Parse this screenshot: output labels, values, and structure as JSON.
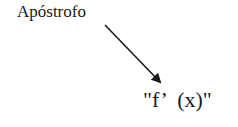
{
  "diagram": {
    "label": "Apóstrofo",
    "formula": "\"f’  (x)\"",
    "arrow": {
      "from": [
        105,
        25
      ],
      "to": [
        162,
        84
      ],
      "color": "#1a1a1a"
    }
  }
}
